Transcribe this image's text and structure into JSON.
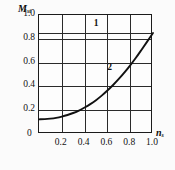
{
  "chart_data": {
    "type": "line",
    "title": "",
    "subtitle": "",
    "xlabel": "n",
    "xlabel_sub": "s",
    "ylabel": "M",
    "ylabel_sub": "st",
    "xlim": [
      0.0,
      1.0
    ],
    "ylim": [
      0.0,
      1.0
    ],
    "grid": true,
    "legend_position": "none",
    "x_ticks": [
      "0.2",
      "0.4",
      "0.6",
      "0.8",
      "1.0"
    ],
    "x_tick_values": [
      0.2,
      0.4,
      0.6,
      0.8,
      1.0
    ],
    "y_ticks": [
      "0",
      "0.2",
      "0.4",
      "0.6",
      "0.8",
      "1.0"
    ],
    "y_tick_values": [
      0.0,
      0.2,
      0.4,
      0.6,
      0.8,
      1.0
    ],
    "origin_label": "0",
    "annotations": [
      {
        "text": "1",
        "x": 0.5,
        "y": 1.09
      },
      {
        "text": "2",
        "x": 0.62,
        "y": 0.625
      }
    ],
    "series": [
      {
        "name": "2",
        "color": "#111111",
        "x": [
          0.0,
          0.05,
          0.1,
          0.15,
          0.2,
          0.25,
          0.3,
          0.35,
          0.4,
          0.45,
          0.5,
          0.55,
          0.6,
          0.65,
          0.7,
          0.75,
          0.8,
          0.85,
          0.9,
          0.95,
          1.0
        ],
        "values": [
          0.145,
          0.147,
          0.152,
          0.16,
          0.172,
          0.188,
          0.208,
          0.232,
          0.262,
          0.296,
          0.335,
          0.38,
          0.43,
          0.485,
          0.545,
          0.61,
          0.68,
          0.755,
          0.835,
          0.917,
          1.0
        ]
      }
    ]
  }
}
